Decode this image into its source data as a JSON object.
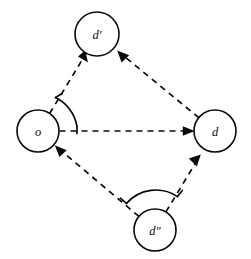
{
  "diagram": {
    "background_color": "#ffffff",
    "stroke_color": "#0a0a0a",
    "nodes": [
      {
        "id": "o",
        "label": "o",
        "cx": 38,
        "cy": 131,
        "r": 21
      },
      {
        "id": "dprime",
        "label": "d′",
        "cx": 97,
        "cy": 34,
        "r": 22
      },
      {
        "id": "d",
        "label": "d",
        "cx": 215,
        "cy": 131,
        "r": 21
      },
      {
        "id": "ddprime",
        "label": "d″",
        "cx": 155,
        "cy": 230,
        "r": 21
      }
    ],
    "edges": [
      {
        "from": "o",
        "to": "dprime",
        "style": "dashed",
        "arrow": "to"
      },
      {
        "from": "o",
        "to": "d",
        "style": "dashed",
        "arrow": "to"
      },
      {
        "from": "d",
        "to": "dprime",
        "style": "dashed",
        "arrow": "to"
      },
      {
        "from": "ddprime",
        "to": "o",
        "style": "dashed",
        "arrow": "to"
      },
      {
        "from": "ddprime",
        "to": "d",
        "style": "dashed",
        "arrow": "to"
      }
    ],
    "angle_arcs": [
      {
        "at": "o",
        "between": [
          "dprime",
          "d"
        ],
        "ticks": 2
      },
      {
        "at": "ddprime",
        "between": [
          "o",
          "d"
        ],
        "ticks": 2
      }
    ]
  }
}
